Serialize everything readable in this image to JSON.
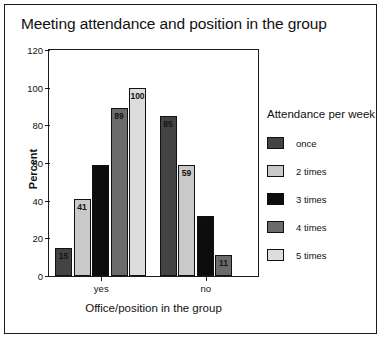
{
  "chart_data": {
    "type": "bar",
    "title": "Meeting attendance and position in the group",
    "xlabel": "Office/position in the group",
    "ylabel": "Percent",
    "categories": [
      "yes",
      "no"
    ],
    "ylim": [
      0,
      120
    ],
    "yticks": [
      0,
      20,
      40,
      60,
      80,
      100,
      120
    ],
    "ytick_labels": [
      "0",
      "20",
      "40",
      "60",
      "80",
      "100",
      "120"
    ],
    "grid": false,
    "legend_title": "Attendance per week",
    "legend_position": "right",
    "series": [
      {
        "name": "once",
        "color": "#434343",
        "values": [
          15,
          85
        ],
        "labels": [
          "15",
          "85"
        ]
      },
      {
        "name": "2 times",
        "color": "#c9c9c9",
        "values": [
          41,
          59
        ],
        "labels": [
          "41",
          "59"
        ]
      },
      {
        "name": "3 times",
        "color": "#0d0d0d",
        "values": [
          59,
          32
        ],
        "labels": [
          "59",
          "32"
        ]
      },
      {
        "name": "4 times",
        "color": "#6b6b6b",
        "values": [
          89,
          11
        ],
        "labels": [
          "89",
          "11"
        ]
      },
      {
        "name": "5 times",
        "color": "#dcdcdc",
        "values": [
          100,
          0
        ],
        "labels": [
          "100",
          ""
        ]
      }
    ]
  }
}
